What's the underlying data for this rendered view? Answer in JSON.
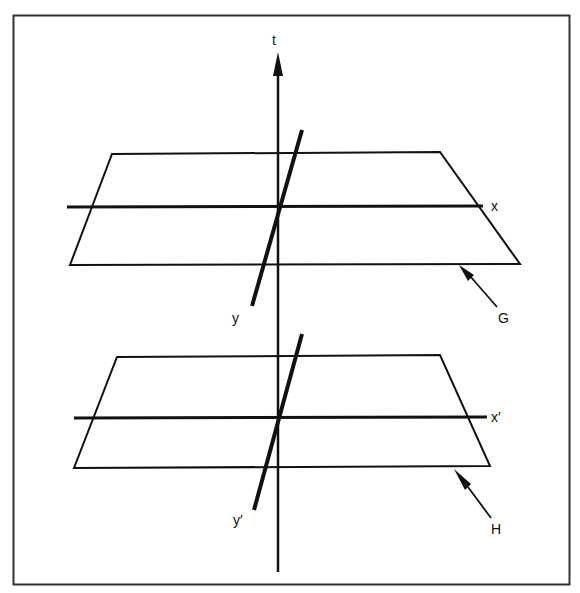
{
  "diagram": {
    "labels": {
      "t": "t",
      "x": "x",
      "y": "y",
      "x_prime": "x′",
      "y_prime": "y′",
      "G": "G",
      "H": "H"
    },
    "colors": {
      "stroke": "#111111",
      "frame": "#333333",
      "background": "#ffffff"
    }
  }
}
